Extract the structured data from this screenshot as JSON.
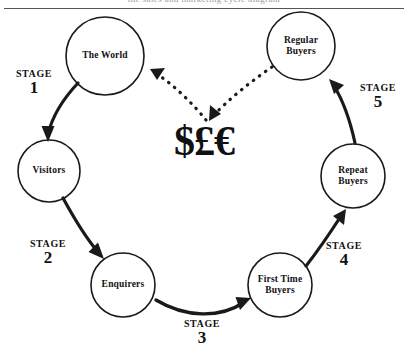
{
  "diagram": {
    "title_clipped": "the sales and marketing cycle diagram",
    "center_symbol": "$£€",
    "nodes": [
      {
        "id": "the-world",
        "label": "The World",
        "cx": 105,
        "cy": 56,
        "r": 39
      },
      {
        "id": "regular-buyers",
        "label": "Regular\nBuyers",
        "cx": 301,
        "cy": 46,
        "r": 34
      },
      {
        "id": "visitors",
        "label": "Visitors",
        "cx": 49,
        "cy": 171,
        "r": 31
      },
      {
        "id": "repeat-buyers",
        "label": "Repeat\nBuyers",
        "cx": 353,
        "cy": 176,
        "r": 32
      },
      {
        "id": "enquirers",
        "label": "Enquirers",
        "cx": 123,
        "cy": 285,
        "r": 32
      },
      {
        "id": "first-time-buyers",
        "label": "First Time\nBuyers",
        "cx": 280,
        "cy": 285,
        "r": 32
      }
    ],
    "stages": [
      {
        "id": "stage-1",
        "word": "STAGE",
        "number": "1",
        "x": 8,
        "y": 68
      },
      {
        "id": "stage-2",
        "word": "STAGE",
        "number": "2",
        "x": 22,
        "y": 238
      },
      {
        "id": "stage-3",
        "word": "STAGE",
        "number": "3",
        "x": 176,
        "y": 318
      },
      {
        "id": "stage-4",
        "word": "STAGE",
        "number": "4",
        "x": 318,
        "y": 240
      },
      {
        "id": "stage-5",
        "word": "STAGE",
        "number": "5",
        "x": 352,
        "y": 82
      }
    ],
    "colors": {
      "stroke": "#1a1a1a",
      "text": "#111111",
      "background": "#ffffff",
      "rule": "#555555"
    }
  }
}
